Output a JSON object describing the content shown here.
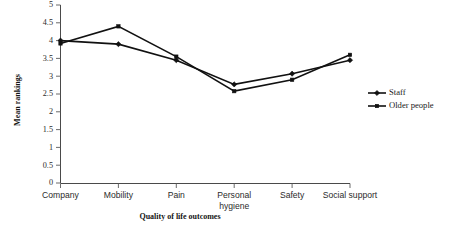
{
  "chart_data": {
    "type": "line",
    "title": "",
    "xlabel": "Quality of life outcomes",
    "ylabel": "Mean rankings",
    "categories": [
      "Company",
      "Mobility",
      "Pain",
      "Personal hygiene",
      "Safety",
      "Social support"
    ],
    "category_lines": [
      [
        "Company"
      ],
      [
        "Mobility"
      ],
      [
        "Pain"
      ],
      [
        "Personal",
        "hygiene"
      ],
      [
        "Safety"
      ],
      [
        "Social support"
      ]
    ],
    "series": [
      {
        "name": "Staff",
        "marker": "diamond",
        "values": [
          4.0,
          3.9,
          3.45,
          2.77,
          3.07,
          3.45
        ]
      },
      {
        "name": "Older people",
        "marker": "square",
        "values": [
          3.92,
          4.4,
          3.55,
          2.58,
          2.9,
          3.6
        ]
      }
    ],
    "ylim": [
      0,
      5
    ],
    "ytick_values": [
      0,
      0.5,
      1,
      1.5,
      2,
      2.5,
      3,
      3.5,
      4,
      4.5,
      5
    ],
    "ytick_labels": [
      "0",
      "0.5",
      "1",
      "1.5",
      "2",
      "2.5",
      "3",
      "3.5",
      "4",
      "4.5",
      "5"
    ],
    "grid": false,
    "legend_position": "right",
    "colors": {
      "staff": "#111111",
      "older_people": "#111111",
      "axis": "#4a4a4a",
      "background": "#ffffff"
    }
  },
  "legend": {
    "entries": [
      {
        "label": "Staff",
        "marker": "diamond-icon"
      },
      {
        "label": "Older people",
        "marker": "square-icon"
      }
    ]
  }
}
